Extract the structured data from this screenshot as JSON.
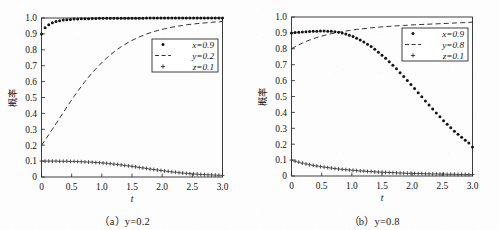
{
  "figure": {
    "background_color": "#fdfdfd",
    "ink_color": "#1a1a1a"
  },
  "panels": [
    {
      "id": "panel-a",
      "caption": "（a）y=0.2",
      "caption_prefix": "（a）",
      "caption_body": "y=0.2",
      "ylabel": "概率",
      "xlabel": "t",
      "legend": [
        {
          "label": "x=0.9",
          "marker": "dot"
        },
        {
          "label": "y=0.2",
          "marker": "dashed-line"
        },
        {
          "label": "z=0.1",
          "marker": "plus"
        }
      ]
    },
    {
      "id": "panel-b",
      "caption": "（b）y=0.8",
      "caption_prefix": "（b）",
      "caption_body": "y=0.8",
      "ylabel": "概率",
      "xlabel": "t",
      "legend": [
        {
          "label": "x=0.9",
          "marker": "dot"
        },
        {
          "label": "y=0.8",
          "marker": "dashed-line"
        },
        {
          "label": "z=0.1",
          "marker": "plus"
        }
      ]
    }
  ],
  "chart_data": [
    {
      "type": "line",
      "id": "panel-a",
      "title": "（a）y=0.2",
      "xlabel": "t",
      "ylabel": "概率",
      "xlim": [
        0,
        3.0
      ],
      "ylim": [
        0,
        1.0
      ],
      "xticks": [
        0,
        0.5,
        1.0,
        1.5,
        2.0,
        2.5,
        3.0
      ],
      "xticklabels": [
        "0",
        "0.5",
        "1.0",
        "1.5",
        "2.0",
        "2.5",
        "3.0"
      ],
      "yticks": [
        0,
        0.1,
        0.2,
        0.3,
        0.4,
        0.5,
        0.6,
        0.7,
        0.8,
        0.9,
        1.0
      ],
      "yticklabels": [
        "0",
        "0.1",
        "0.2",
        "0.3",
        "0.4",
        "0.5",
        "0.6",
        "0.7",
        "0.8",
        "0.9",
        "1.0"
      ],
      "grid": false,
      "legend_position": "center-right",
      "x": [
        0.0,
        0.06,
        0.12,
        0.18,
        0.24,
        0.3,
        0.36,
        0.42,
        0.48,
        0.54,
        0.6,
        0.66,
        0.72,
        0.78,
        0.84,
        0.9,
        0.96,
        1.02,
        1.08,
        1.14,
        1.2,
        1.26,
        1.32,
        1.38,
        1.44,
        1.5,
        1.56,
        1.62,
        1.68,
        1.74,
        1.8,
        1.86,
        1.92,
        1.98,
        2.04,
        2.1,
        2.16,
        2.22,
        2.28,
        2.34,
        2.4,
        2.46,
        2.52,
        2.58,
        2.64,
        2.7,
        2.76,
        2.82,
        2.88,
        2.94,
        3.0
      ],
      "series": [
        {
          "name": "x=0.9",
          "marker": "dot",
          "values": [
            0.9,
            0.938,
            0.958,
            0.97,
            0.978,
            0.983,
            0.987,
            0.989,
            0.991,
            0.993,
            0.994,
            0.995,
            0.996,
            0.996,
            0.997,
            0.997,
            0.998,
            0.998,
            0.998,
            0.998,
            0.999,
            0.999,
            0.999,
            0.999,
            0.999,
            0.999,
            0.999,
            0.999,
            0.999,
            1.0,
            1.0,
            1.0,
            1.0,
            1.0,
            1.0,
            1.0,
            1.0,
            1.0,
            1.0,
            1.0,
            1.0,
            1.0,
            1.0,
            1.0,
            1.0,
            1.0,
            1.0,
            1.0,
            1.0,
            1.0,
            1.0
          ]
        },
        {
          "name": "y=0.2",
          "marker": "dashed-line",
          "values": [
            0.2,
            0.232,
            0.266,
            0.3,
            0.335,
            0.37,
            0.405,
            0.44,
            0.474,
            0.507,
            0.539,
            0.57,
            0.6,
            0.628,
            0.655,
            0.68,
            0.704,
            0.727,
            0.748,
            0.768,
            0.786,
            0.803,
            0.819,
            0.833,
            0.847,
            0.859,
            0.87,
            0.881,
            0.89,
            0.899,
            0.907,
            0.914,
            0.921,
            0.927,
            0.932,
            0.937,
            0.942,
            0.946,
            0.95,
            0.953,
            0.957,
            0.96,
            0.962,
            0.965,
            0.967,
            0.969,
            0.971,
            0.973,
            0.975,
            0.976,
            0.978
          ]
        },
        {
          "name": "z=0.1",
          "marker": "plus",
          "values": [
            0.1,
            0.1,
            0.1,
            0.1,
            0.1,
            0.099,
            0.099,
            0.099,
            0.098,
            0.098,
            0.097,
            0.096,
            0.095,
            0.094,
            0.093,
            0.091,
            0.09,
            0.088,
            0.086,
            0.084,
            0.081,
            0.079,
            0.076,
            0.073,
            0.07,
            0.067,
            0.064,
            0.06,
            0.057,
            0.054,
            0.05,
            0.047,
            0.044,
            0.041,
            0.038,
            0.035,
            0.032,
            0.03,
            0.027,
            0.025,
            0.023,
            0.021,
            0.019,
            0.018,
            0.016,
            0.015,
            0.014,
            0.013,
            0.012,
            0.011,
            0.01
          ]
        }
      ]
    },
    {
      "type": "line",
      "id": "panel-b",
      "title": "（b）y=0.8",
      "xlabel": "t",
      "ylabel": "概率",
      "xlim": [
        0,
        3.0
      ],
      "ylim": [
        0,
        1.0
      ],
      "xticks": [
        0,
        0.5,
        1.0,
        1.5,
        2.0,
        2.5,
        3.0
      ],
      "xticklabels": [
        "0",
        "0.5",
        "1.0",
        "1.5",
        "2.0",
        "2.5",
        "3.0"
      ],
      "yticks": [
        0,
        0.1,
        0.2,
        0.3,
        0.4,
        0.5,
        0.6,
        0.7,
        0.8,
        0.9,
        1.0
      ],
      "yticklabels": [
        "0",
        "0.1",
        "0.2",
        "0.3",
        "0.4",
        "0.5",
        "0.6",
        "0.7",
        "0.8",
        "0.9",
        "1.0"
      ],
      "grid": false,
      "legend_position": "upper-right",
      "x": [
        0.0,
        0.06,
        0.12,
        0.18,
        0.24,
        0.3,
        0.36,
        0.42,
        0.48,
        0.54,
        0.6,
        0.66,
        0.72,
        0.78,
        0.84,
        0.9,
        0.96,
        1.02,
        1.08,
        1.14,
        1.2,
        1.26,
        1.32,
        1.38,
        1.44,
        1.5,
        1.56,
        1.62,
        1.68,
        1.74,
        1.8,
        1.86,
        1.92,
        1.98,
        2.04,
        2.1,
        2.16,
        2.22,
        2.28,
        2.34,
        2.4,
        2.46,
        2.52,
        2.58,
        2.64,
        2.7,
        2.76,
        2.82,
        2.88,
        2.94,
        3.0
      ],
      "series": [
        {
          "name": "x=0.9",
          "marker": "dot",
          "values": [
            0.9,
            0.902,
            0.904,
            0.906,
            0.908,
            0.909,
            0.91,
            0.911,
            0.912,
            0.912,
            0.911,
            0.91,
            0.907,
            0.904,
            0.899,
            0.893,
            0.886,
            0.877,
            0.867,
            0.856,
            0.843,
            0.829,
            0.814,
            0.797,
            0.779,
            0.76,
            0.74,
            0.719,
            0.697,
            0.674,
            0.65,
            0.626,
            0.601,
            0.576,
            0.55,
            0.524,
            0.498,
            0.472,
            0.447,
            0.421,
            0.396,
            0.372,
            0.348,
            0.325,
            0.303,
            0.282,
            0.262,
            0.243,
            0.225,
            0.208,
            0.183
          ]
        },
        {
          "name": "y=0.8",
          "marker": "dashed-line",
          "values": [
            0.8,
            0.813,
            0.825,
            0.836,
            0.846,
            0.855,
            0.863,
            0.871,
            0.878,
            0.884,
            0.89,
            0.895,
            0.9,
            0.904,
            0.908,
            0.912,
            0.915,
            0.919,
            0.922,
            0.924,
            0.927,
            0.929,
            0.932,
            0.934,
            0.936,
            0.938,
            0.939,
            0.941,
            0.943,
            0.944,
            0.946,
            0.947,
            0.948,
            0.95,
            0.951,
            0.952,
            0.953,
            0.954,
            0.955,
            0.956,
            0.957,
            0.958,
            0.959,
            0.96,
            0.961,
            0.962,
            0.963,
            0.964,
            0.965,
            0.966,
            0.968
          ]
        },
        {
          "name": "z=0.1",
          "marker": "plus",
          "values": [
            0.1,
            0.093,
            0.087,
            0.081,
            0.076,
            0.071,
            0.067,
            0.063,
            0.059,
            0.056,
            0.053,
            0.05,
            0.047,
            0.044,
            0.042,
            0.04,
            0.038,
            0.036,
            0.034,
            0.032,
            0.031,
            0.029,
            0.028,
            0.026,
            0.025,
            0.024,
            0.023,
            0.022,
            0.021,
            0.02,
            0.019,
            0.018,
            0.017,
            0.017,
            0.016,
            0.015,
            0.015,
            0.014,
            0.014,
            0.013,
            0.013,
            0.012,
            0.012,
            0.011,
            0.011,
            0.011,
            0.01,
            0.01,
            0.01,
            0.009,
            0.009
          ]
        }
      ]
    }
  ]
}
